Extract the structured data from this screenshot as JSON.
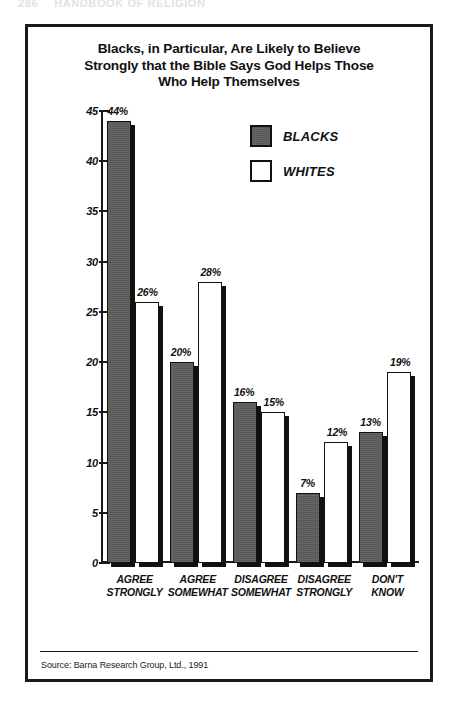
{
  "page_header": {
    "page_number": "286",
    "running_head": "HANDBOOK OF RELIGION"
  },
  "figure": {
    "title_lines": [
      "Blacks, in Particular, Are Likely to Believe",
      "Strongly that the Bible Says God Helps Those",
      "Who Help Themselves"
    ],
    "source": "Source: Barna Research Group, Ltd., 1991"
  },
  "chart_data": {
    "type": "bar",
    "title": "Blacks, in Particular, Are Likely to Believe Strongly that the Bible Says God Helps Those Who Help Themselves",
    "xlabel": "",
    "ylabel": "",
    "ylim": [
      0,
      45
    ],
    "yticks": [
      0,
      5,
      10,
      15,
      20,
      25,
      30,
      35,
      40,
      45
    ],
    "ytick_labels": [
      "0",
      "5",
      "10",
      "15",
      "20",
      "25",
      "30",
      "35",
      "40",
      "45"
    ],
    "grid": false,
    "legend_position": "upper right",
    "categories": [
      [
        "AGREE",
        "STRONGLY"
      ],
      [
        "AGREE",
        "SOMEWHAT"
      ],
      [
        "DISAGREE",
        "SOMEWHAT"
      ],
      [
        "DISAGREE",
        "STRONGLY"
      ],
      [
        "DON'T",
        "KNOW"
      ]
    ],
    "category_labels": [
      "AGREE STRONGLY",
      "AGREE SOMEWHAT",
      "DISAGREE SOMEWHAT",
      "DISAGREE STRONGLY",
      "DON'T KNOW"
    ],
    "series": [
      {
        "name": "BLACKS",
        "color": "#5c5c5c",
        "values": [
          44,
          20,
          16,
          7,
          13
        ],
        "data_labels": [
          "44%",
          "20%",
          "16%",
          "7%",
          "13%"
        ]
      },
      {
        "name": "WHITES",
        "color": "#ffffff",
        "values": [
          26,
          28,
          15,
          12,
          19
        ],
        "data_labels": [
          "26%",
          "28%",
          "15%",
          "12%",
          "19%"
        ]
      }
    ]
  }
}
